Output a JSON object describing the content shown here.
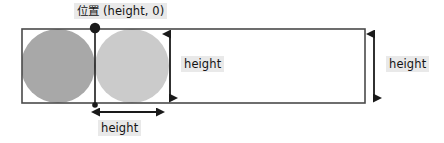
{
  "diagram": {
    "type": "geometry-annotation",
    "canvas": {
      "width": 444,
      "height": 143,
      "background": "#ffffff"
    },
    "labels": {
      "position_point": "位置 (height, 0)",
      "height_inner": "height",
      "height_bottom": "height",
      "height_right": "height"
    },
    "shapes": {
      "rectangle": {
        "name": "bounding-rectangle",
        "x": 22,
        "y": 29,
        "width": 343,
        "height": 74,
        "fill": "#ffffff",
        "stroke": "#4a4a4a",
        "stroke_width": 1.6
      },
      "circle_left": {
        "name": "circle-left",
        "cx": 58,
        "cy": 66,
        "r": 37,
        "fill": "#a8a8a8"
      },
      "circle_right": {
        "name": "circle-right",
        "cx": 132,
        "cy": 66,
        "r": 37,
        "fill": "#cbcbcb"
      },
      "marker_dot": {
        "name": "position-marker-dot",
        "cx": 95,
        "cy": 28,
        "r": 5.2,
        "fill": "#1a1a1a"
      },
      "vertical_guide_line": {
        "name": "vertical-guide-line",
        "x": 95,
        "y1": 28,
        "y2": 106,
        "stroke": "#1a1a1a",
        "stroke_width": 1.6
      }
    },
    "arrows": {
      "height_inner": {
        "name": "height-arrow-inner-vertical",
        "orientation": "vertical",
        "x": 170,
        "y1": 31,
        "y2": 101,
        "stroke": "#1a1a1a",
        "stroke_width": 1.8
      },
      "height_bottom": {
        "name": "height-arrow-bottom-horizontal",
        "orientation": "horizontal",
        "y": 112,
        "x1": 96,
        "x2": 160,
        "stroke": "#1a1a1a",
        "stroke_width": 1.8
      },
      "height_right": {
        "name": "height-arrow-right-vertical",
        "orientation": "vertical",
        "x": 374,
        "y1": 31,
        "y2": 101,
        "stroke": "#1a1a1a",
        "stroke_width": 1.8
      }
    },
    "colors": {
      "label_background": "#e9e9e9",
      "text": "#141414",
      "rect_stroke": "#4a4a4a",
      "circle_dark": "#a8a8a8",
      "circle_light": "#cbcbcb",
      "arrow": "#1a1a1a"
    }
  }
}
